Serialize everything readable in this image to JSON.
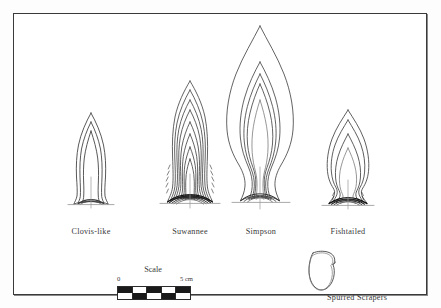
{
  "figure": {
    "type": "archaeological-typology-plate",
    "background": "#ffffff",
    "frame_color": "#3a3a3a",
    "line_color": "#2b2b2b"
  },
  "points": [
    {
      "id": "clovis-like",
      "label": "Clovis-like",
      "outline_count": 3,
      "relative_size": "small",
      "blade_form": "lanceolate, slightly shouldered",
      "base": "concave fluted base",
      "has_axis_line": true
    },
    {
      "id": "suwannee",
      "label": "Suwannee",
      "outline_count": 8,
      "relative_size": "medium",
      "blade_form": "waisted lanceolate, many superimposed outlines",
      "base": "incurvate recurved base, heavily shaded",
      "has_axis_line": true
    },
    {
      "id": "simpson",
      "label": "Simpson",
      "outline_count": 5,
      "relative_size": "large",
      "blade_form": "broad flame-shaped with strongly waisted haft",
      "base": "flaring concave base",
      "has_axis_line": true
    },
    {
      "id": "fishtailed",
      "label": "Fishtailed",
      "outline_count": 4,
      "relative_size": "medium",
      "blade_form": "triangular blade with constricted stem",
      "base": "expanding fishtail base, dark shading",
      "has_axis_line": true
    }
  ],
  "scale": {
    "title": "Scale",
    "min_label": "0",
    "max_label": "5 cm",
    "units": "cm",
    "length_cm": 5,
    "segments": 5,
    "style": "two-row checkerboard"
  },
  "scraper": {
    "label": "Spurred Scrapers",
    "outline_count": 2,
    "form": "sub-triangular end scraper with lateral spur"
  }
}
